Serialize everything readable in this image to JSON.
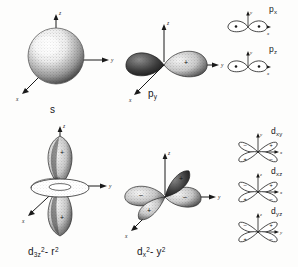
{
  "figure": {
    "background_color": "#fdfdfc",
    "ink_color": "#1a1a1a"
  },
  "panels": [
    {
      "id": "s-orbital",
      "label": "s",
      "label_html": "s",
      "style": "stippled-3d",
      "shape": "sphere",
      "axes": [
        "z",
        "y",
        "x"
      ],
      "signs": []
    },
    {
      "id": "py-orbital",
      "label": "py",
      "label_main": "p",
      "label_sub": "y",
      "style": "stippled-3d",
      "shape": "two-lobes-along-y",
      "axes": [
        "z",
        "y",
        "x"
      ],
      "signs": [
        "+"
      ]
    },
    {
      "id": "dz2-orbital",
      "label": "d3z2-r2",
      "label_main": "d",
      "label_sub": "3z",
      "label_sub_sup": "2",
      "label_tail": "- r",
      "label_tail_sup": "2",
      "style": "stippled-3d",
      "shape": "two-lobes-along-z-with-torus",
      "axes": [
        "z",
        "y",
        "x"
      ],
      "signs": [
        "+",
        "+"
      ]
    },
    {
      "id": "dx2y2-orbital",
      "label": "dx2-y2",
      "label_main": "d",
      "label_sub": "x",
      "label_sub_sup": "2",
      "label_tail": "- y",
      "label_tail_sup": "2",
      "style": "stippled-3d",
      "shape": "four-lobes-in-xy-plane",
      "axes": [
        "z",
        "y",
        "x"
      ],
      "signs": [
        "+",
        "-",
        "-",
        "+"
      ]
    }
  ],
  "small_panels": [
    {
      "id": "px-small",
      "label_main": "p",
      "label_sub": "x",
      "style": "outline-2d",
      "shape": "two-lobes-horizontal",
      "axis_vertical": "y",
      "axis_horizontal": "x",
      "signs": []
    },
    {
      "id": "pz-small",
      "label_main": "p",
      "label_sub": "z",
      "style": "outline-2d",
      "shape": "two-lobes-horizontal",
      "axis_vertical": "y",
      "axis_horizontal": "x",
      "signs": []
    },
    {
      "id": "dxy-small",
      "label_main": "d",
      "label_sub": "xy",
      "style": "outline-2d",
      "shape": "four-lobes-diagonal",
      "axis_vertical": "y",
      "axis_horizontal": "x",
      "signs": [
        "-",
        "+",
        "+",
        "-"
      ]
    },
    {
      "id": "dxz-small",
      "label_main": "d",
      "label_sub": "xz",
      "style": "outline-2d",
      "shape": "four-lobes-diagonal",
      "axis_vertical": "z",
      "axis_horizontal": "x",
      "signs": [
        "-",
        "+",
        "+",
        "-"
      ]
    },
    {
      "id": "dyz-small",
      "label_main": "d",
      "label_sub": "yz",
      "style": "outline-2d",
      "shape": "four-lobes-diagonal",
      "axis_vertical": "z",
      "axis_horizontal": "y",
      "signs": [
        "-",
        "+",
        "+",
        "-"
      ]
    }
  ],
  "axis_labels": {
    "x": "x",
    "y": "y",
    "z": "z"
  },
  "sign_symbols": {
    "plus": "+",
    "minus": "-"
  }
}
